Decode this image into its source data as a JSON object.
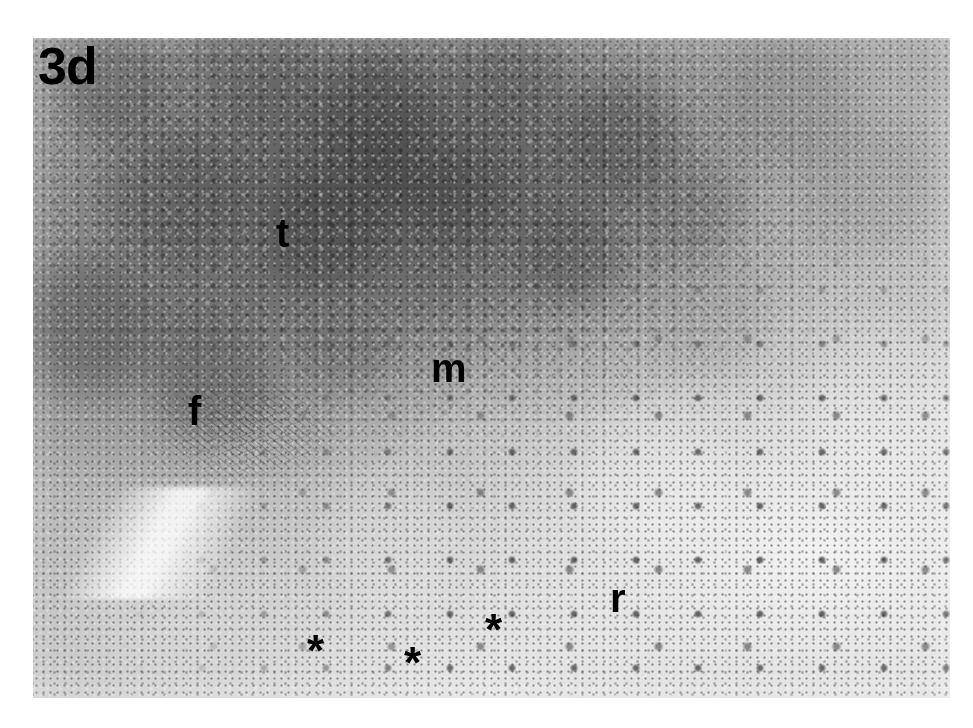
{
  "figure": {
    "panel_label": "3d",
    "caption_present": false,
    "image_kind": "electron-micrograph",
    "colors": {
      "ink": "#000000",
      "page_background": "#ffffff",
      "plate_dark_tone": "#6a6a6a",
      "plate_mid_tone": "#9a9a9a",
      "plate_light_tone": "#e2e2e2"
    }
  },
  "plate": {
    "left": 33,
    "top": 38,
    "width": 917,
    "height": 660
  },
  "annotations": [
    {
      "id": "panel-label",
      "text": "3d",
      "kind": "panel-label",
      "x": 38,
      "y": 40,
      "size": 52
    },
    {
      "id": "label-t",
      "text": "t",
      "kind": "region-label",
      "x": 276,
      "y": 213,
      "size": 40
    },
    {
      "id": "label-m",
      "text": "m",
      "kind": "region-label",
      "x": 431,
      "y": 348,
      "size": 40
    },
    {
      "id": "label-f",
      "text": "f",
      "kind": "region-label",
      "x": 188,
      "y": 391,
      "size": 40
    },
    {
      "id": "label-r",
      "text": "r",
      "kind": "region-label",
      "x": 610,
      "y": 578,
      "size": 40
    },
    {
      "id": "marker-asterisk-1",
      "text": "*",
      "kind": "asterisk-marker",
      "x": 307,
      "y": 629,
      "size": 44
    },
    {
      "id": "marker-asterisk-2",
      "text": "*",
      "kind": "asterisk-marker",
      "x": 404,
      "y": 641,
      "size": 44
    },
    {
      "id": "marker-asterisk-3",
      "text": "*",
      "kind": "asterisk-marker",
      "x": 485,
      "y": 608,
      "size": 44
    }
  ]
}
